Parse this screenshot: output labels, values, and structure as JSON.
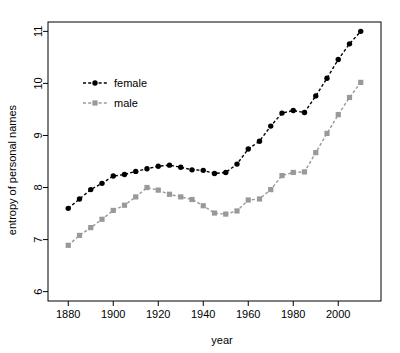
{
  "chart_data": {
    "type": "line",
    "title": "",
    "xlabel": "year",
    "ylabel": "entropy of personal names",
    "xlim": [
      1871,
      2019
    ],
    "ylim": [
      5.82,
      11.18
    ],
    "xticks": [
      1880,
      1900,
      1920,
      1940,
      1960,
      1980,
      2000
    ],
    "yticks": [
      6,
      7,
      8,
      9,
      10,
      11
    ],
    "grid": false,
    "legend_position": "upper left",
    "x": [
      1880,
      1885,
      1890,
      1895,
      1900,
      1905,
      1910,
      1915,
      1920,
      1925,
      1930,
      1935,
      1940,
      1945,
      1950,
      1955,
      1960,
      1965,
      1970,
      1975,
      1980,
      1985,
      1990,
      1995,
      2000,
      2005,
      2010
    ],
    "series": [
      {
        "name": "female",
        "color": "#000000",
        "marker": "circle",
        "values": [
          7.6,
          7.78,
          7.96,
          8.08,
          8.22,
          8.25,
          8.31,
          8.36,
          8.41,
          8.43,
          8.39,
          8.34,
          8.33,
          8.27,
          8.29,
          8.45,
          8.74,
          8.89,
          9.18,
          9.43,
          9.48,
          9.44,
          9.76,
          10.1,
          10.46,
          10.76,
          11.0
        ]
      },
      {
        "name": "male",
        "color": "#999999",
        "marker": "square",
        "values": [
          6.89,
          7.08,
          7.23,
          7.39,
          7.56,
          7.66,
          7.82,
          8.0,
          7.95,
          7.87,
          7.82,
          7.77,
          7.65,
          7.51,
          7.49,
          7.55,
          7.76,
          7.78,
          7.96,
          8.23,
          8.29,
          8.3,
          8.67,
          9.04,
          9.4,
          9.73,
          10.02
        ]
      }
    ],
    "legend_entries": [
      {
        "label": "female",
        "color": "#000000",
        "marker": "circle"
      },
      {
        "label": "male",
        "color": "#999999",
        "marker": "square"
      }
    ]
  },
  "axis": {
    "x_tick_labels": [
      "1880",
      "1900",
      "1920",
      "1940",
      "1960",
      "1980",
      "2000"
    ],
    "y_tick_labels": [
      "6",
      "7",
      "8",
      "9",
      "10",
      "11"
    ],
    "x_axis_title": "year",
    "y_axis_title": "entropy of personal names"
  },
  "legend": {
    "items": [
      {
        "label": "female"
      },
      {
        "label": "male"
      }
    ]
  }
}
